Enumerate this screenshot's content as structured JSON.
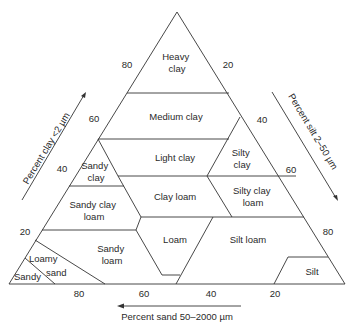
{
  "diagram": {
    "type": "soil-texture-triangle",
    "colors": {
      "line": "#333333",
      "text": "#2a2a2a",
      "background": "#ffffff"
    },
    "regions": {
      "heavy_clay": [
        "Heavy",
        "clay"
      ],
      "medium_clay": "Medium clay",
      "light_clay": "Light clay",
      "silty_clay": [
        "Silty",
        "clay"
      ],
      "sandy_clay": [
        "Sandy",
        "clay"
      ],
      "clay_loam": "Clay loam",
      "silty_clay_loam": [
        "Silty clay",
        "loam"
      ],
      "sandy_clay_loam": [
        "Sandy clay",
        "loam"
      ],
      "loam": "Loam",
      "silt_loam": "Silt loam",
      "sandy_loam": [
        "Sandy",
        "loam"
      ],
      "loamy_sand": [
        "Loamy",
        "sand"
      ],
      "sandy": "Sandy",
      "silt": "Silt"
    },
    "axes": {
      "clay": {
        "label": "Percent clay <2 µm",
        "ticks": [
          "80",
          "60",
          "40",
          "20"
        ]
      },
      "silt": {
        "label": "Percent silt 2–50 µm",
        "ticks": [
          "20",
          "40",
          "60",
          "80"
        ]
      },
      "sand": {
        "label": "Percent sand 50–2000 µm",
        "ticks": [
          "80",
          "60",
          "40",
          "20"
        ]
      }
    }
  }
}
